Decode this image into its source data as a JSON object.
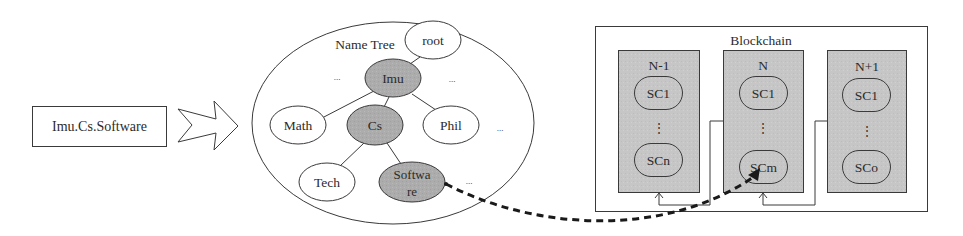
{
  "input": {
    "label": "Imu.Cs.Software"
  },
  "arrow": {
    "icon": "hollow-right-arrow-icon"
  },
  "name_tree": {
    "title": "Name Tree",
    "nodes": [
      {
        "id": "root",
        "label": "root",
        "highlighted": false
      },
      {
        "id": "imu",
        "label": "Imu",
        "highlighted": true
      },
      {
        "id": "math",
        "label": "Math",
        "highlighted": false
      },
      {
        "id": "cs",
        "label": "Cs",
        "highlighted": true
      },
      {
        "id": "phil",
        "label": "Phil",
        "highlighted": false
      },
      {
        "id": "tech",
        "label": "Tech",
        "highlighted": false
      },
      {
        "id": "software",
        "label_line1": "Softwa",
        "label_line2": "re",
        "highlighted": true
      }
    ],
    "ellipsis": "..."
  },
  "blockchain": {
    "title": "Blockchain",
    "blocks": [
      {
        "label": "N-1",
        "first": "SC1",
        "vdots": "⋮",
        "last": "SCn"
      },
      {
        "label": "N",
        "first": "SC1",
        "vdots": "⋮",
        "last": "SCm"
      },
      {
        "label": "N+1",
        "first": "SC1",
        "vdots": "⋮",
        "last": "SCo"
      }
    ]
  },
  "colors": {
    "highlight_fill": "#b4b4b4",
    "block_fill": "#c9c9c9",
    "stroke": "#3a3a3a",
    "dashed_link": "#1a1a1a"
  }
}
